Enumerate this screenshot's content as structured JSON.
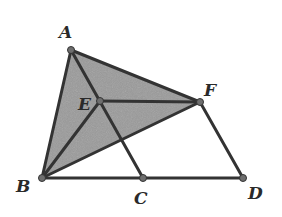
{
  "figure": {
    "points": {
      "A": {
        "label": "A",
        "x": 71,
        "y": 50
      },
      "E": {
        "label": "E",
        "x": 100,
        "y": 101
      },
      "F": {
        "label": "F",
        "x": 200,
        "y": 102
      },
      "B": {
        "label": "B",
        "x": 42,
        "y": 178
      },
      "C": {
        "label": "C",
        "x": 143,
        "y": 178
      },
      "D": {
        "label": "D",
        "x": 243,
        "y": 178
      }
    },
    "segments": [
      "AB",
      "AF",
      "AC",
      "BF",
      "BD",
      "EF",
      "FD",
      "BE"
    ],
    "shaded_regions": [
      "ABF (triangle)"
    ],
    "colors": {
      "stroke": "#3a3a3a",
      "shade": "#9a9a9a",
      "point": "#6e6e6e"
    }
  }
}
